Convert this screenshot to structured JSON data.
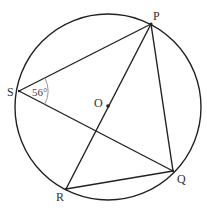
{
  "diagram": {
    "type": "circle-geometry",
    "circle": {
      "center_label": "O",
      "cx": 108,
      "cy": 107,
      "r": 93
    },
    "points": {
      "P": {
        "label": "P",
        "x": 151,
        "y": 24
      },
      "Q": {
        "label": "Q",
        "x": 173,
        "y": 171
      },
      "R": {
        "label": "R",
        "x": 66,
        "y": 189
      },
      "S": {
        "label": "S",
        "x": 19,
        "y": 91
      },
      "O": {
        "label": "O",
        "x": 108,
        "y": 106
      }
    },
    "segments": [
      [
        "S",
        "P"
      ],
      [
        "S",
        "Q"
      ],
      [
        "P",
        "Q"
      ],
      [
        "P",
        "R"
      ],
      [
        "R",
        "Q"
      ]
    ],
    "angle": {
      "vertex": "S",
      "label": "56°",
      "between": [
        "P",
        "Q"
      ]
    },
    "colors": {
      "stroke": "#222222",
      "angle_arc": "#999999",
      "text": "#333333"
    }
  }
}
